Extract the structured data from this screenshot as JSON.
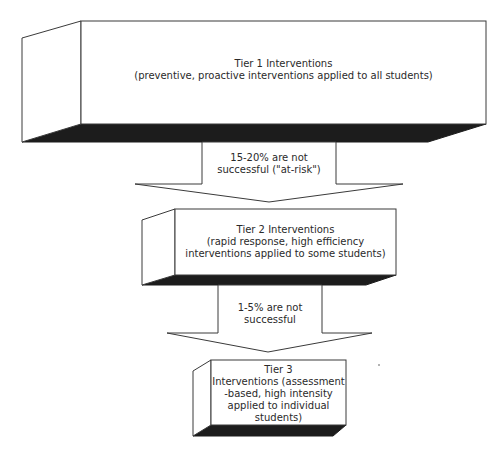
{
  "diagram": {
    "type": "tiered-intervention-flow",
    "colors": {
      "box_fill": "#ffffff",
      "outline": "#3a3a3a",
      "shadow": "#1c1c1c",
      "text": "#2a2a2a"
    },
    "tiers": [
      {
        "title": "Tier 1 Interventions",
        "lines": [
          "Tier 1 Interventions",
          "(preventive, proactive interventions applied to all students)"
        ]
      },
      {
        "title": "Tier 2 Interventions",
        "lines": [
          "Tier 2 Interventions",
          "(rapid response, high efficiency",
          "interventions applied to some students)"
        ]
      },
      {
        "title": "Tier 3",
        "lines": [
          "Tier 3",
          "Interventions (assessment",
          "-based, high intensity",
          "applied to individual",
          "students)"
        ]
      }
    ],
    "arrows": [
      {
        "lines": [
          "15-20% are not",
          "successful (\"at-risk\")"
        ]
      },
      {
        "lines": [
          "1-5% are not",
          "successful"
        ]
      }
    ]
  }
}
